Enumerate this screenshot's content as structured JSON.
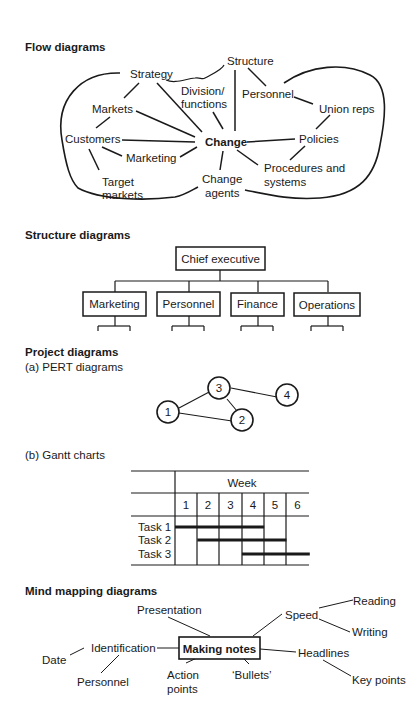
{
  "sections": {
    "flow": {
      "heading": "Flow diagrams",
      "nodes": {
        "strategy": "Strategy",
        "structure": "Structure",
        "division1": "Division/",
        "division2": "functions",
        "personnel": "Personnel",
        "markets": "Markets",
        "union_reps": "Union reps",
        "customers": "Customers",
        "change": "Change",
        "policies": "Policies",
        "marketing": "Marketing",
        "procedures1": "Procedures and",
        "procedures2": "systems",
        "target1": "Target",
        "target2": "markets",
        "agents1": "Change",
        "agents2": "agents"
      }
    },
    "structure": {
      "heading": "Structure diagrams",
      "root": "Chief executive",
      "children": [
        "Marketing",
        "Personnel",
        "Finance",
        "Operations"
      ]
    },
    "project": {
      "heading": "Project diagrams",
      "pert_label": "(a) PERT diagrams",
      "pert_nodes": [
        "1",
        "2",
        "3",
        "4"
      ],
      "gantt_label": "(b) Gantt charts",
      "gantt": {
        "header": "Week",
        "weeks": [
          "1",
          "2",
          "3",
          "4",
          "5",
          "6"
        ],
        "tasks": [
          {
            "name": "Task 1",
            "start": 1,
            "end": 4
          },
          {
            "name": "Task 2",
            "start": 2,
            "end": 5
          },
          {
            "name": "Task 3",
            "start": 4,
            "end": 6
          }
        ]
      }
    },
    "mind": {
      "heading": "Mind mapping diagrams",
      "center": "Making notes",
      "nodes": {
        "presentation": "Presentation",
        "speed": "Speed",
        "reading": "Reading",
        "writing": "Writing",
        "identification": "Identification",
        "date": "Date",
        "personnel": "Personnel",
        "action1": "Action",
        "action2": "points",
        "bullets": "‘Bullets’",
        "headlines": "Headlines",
        "key_points": "Key points"
      }
    }
  }
}
